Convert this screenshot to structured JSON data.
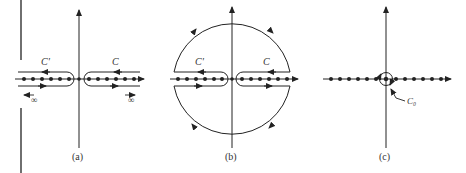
{
  "figure": {
    "colors": {
      "ink": "#222222",
      "background": "#ffffff"
    },
    "panels": [
      {
        "id": "a",
        "caption": "(a)",
        "contour_labels": {
          "left": "C'",
          "right": "C"
        },
        "infinity_labels": {
          "left": "∞",
          "right": "∞"
        }
      },
      {
        "id": "b",
        "caption": "(b)",
        "contour_labels": {
          "left": "C'",
          "right": "C"
        }
      },
      {
        "id": "c",
        "caption": "(c)",
        "contour_labels": {
          "origin": "C₀"
        }
      }
    ]
  }
}
